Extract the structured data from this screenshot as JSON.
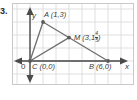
{
  "problem": {
    "number": "3."
  },
  "figure": {
    "type": "coordinate-plane-triangle",
    "axis_labels": {
      "x": "x",
      "y": "y",
      "origin": "0"
    },
    "points": [
      {
        "name": "A",
        "label": "A (1,3)",
        "x": 1,
        "y": 3
      },
      {
        "name": "M",
        "label_prefix": "M (3,1",
        "label_suffix": ")",
        "frac_num": "4",
        "frac_den": "5",
        "x": 3,
        "y": 1.8
      },
      {
        "name": "C",
        "label": "C (0,0)",
        "x": 0,
        "y": 0
      },
      {
        "name": "B",
        "label": "B (6,0)",
        "x": 6,
        "y": 0
      }
    ],
    "segments": [
      {
        "from": "C",
        "to": "A"
      },
      {
        "from": "A",
        "to": "B"
      },
      {
        "from": "C",
        "to": "B"
      },
      {
        "from": "C",
        "to": "M"
      }
    ],
    "colors": {
      "grid": "#d5d5d5",
      "axis": "#4a4a4a",
      "figure": "#6e6e6e",
      "point": "#5a5a5a",
      "text": "#3a3a3a",
      "plate_border": "#c9c9c9"
    },
    "grid": {
      "spacing_px": 13,
      "visible": true
    }
  }
}
